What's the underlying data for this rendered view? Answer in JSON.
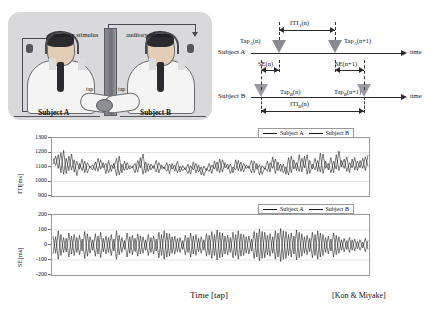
{
  "photo": {
    "stimulus_left_label": "auditory stimulus",
    "stimulus_right_label": "auditory stimulus",
    "tap_left_label": "tap",
    "tap_right_label": "tap",
    "subject_a_label": "Subject A",
    "subject_b_label": "Subject B"
  },
  "timing": {
    "row_a_label": "Subject A",
    "row_b_label": "Subject B",
    "time_axis_a": "time",
    "time_axis_b": "time",
    "iti_a_label": "ITI_A(n)",
    "iti_b_label": "ITI_B(n)",
    "tap_a_n": "Tap_A(n)",
    "tap_a_n1": "Tap_A(n+1)",
    "tap_b_n": "Tap_B(n)",
    "tap_b_n1": "Tap_B(n+1)",
    "se_n": "SE(n)",
    "se_n1": "SE(n+1)"
  },
  "legend": {
    "subject_a": "Subject A",
    "subject_b": "Subject B"
  },
  "captions": {
    "xaxis": "Time [tap]",
    "credit": "[Kon & Miyake]"
  },
  "chart_data": [
    {
      "type": "line",
      "title": "",
      "xlabel": "Time [tap]",
      "ylabel": "ITI [ms]",
      "ylim": [
        900,
        1300
      ],
      "yticks": [
        1300,
        1200,
        1100,
        1000,
        900
      ],
      "grid": true,
      "legend_position": "top-right",
      "x": [
        0,
        1,
        2,
        3,
        4,
        5,
        6,
        7,
        8,
        9,
        10,
        11,
        12,
        13,
        14,
        15,
        16,
        17,
        18,
        19,
        20,
        21,
        22,
        23,
        24,
        25,
        26,
        27,
        28,
        29,
        30,
        31,
        32,
        33,
        34,
        35,
        36,
        37,
        38,
        39,
        40,
        41,
        42,
        43,
        44,
        45,
        46,
        47,
        48,
        49,
        50,
        51,
        52,
        53,
        54,
        55,
        56,
        57,
        58,
        59,
        60,
        61,
        62,
        63,
        64,
        65,
        66,
        67,
        68,
        69,
        70,
        71,
        72,
        73,
        74,
        75,
        76,
        77,
        78,
        79,
        80,
        81,
        82,
        83,
        84,
        85,
        86,
        87,
        88,
        89,
        90,
        91,
        92,
        93,
        94,
        95,
        96,
        97,
        98,
        99,
        100,
        101,
        102,
        103,
        104,
        105,
        106,
        107,
        108,
        109,
        110,
        111,
        112,
        113,
        114,
        115,
        116,
        117,
        118,
        119
      ],
      "series": [
        {
          "name": "Subject A",
          "values": [
            1160,
            1110,
            1185,
            1060,
            1215,
            1055,
            1175,
            1080,
            1150,
            1040,
            1125,
            1075,
            1140,
            1060,
            1105,
            1080,
            1135,
            1070,
            1150,
            1095,
            1125,
            1060,
            1115,
            1090,
            1160,
            1045,
            1120,
            1075,
            1130,
            1085,
            1105,
            1060,
            1145,
            1095,
            1190,
            1060,
            1125,
            1080,
            1110,
            1065,
            1130,
            1090,
            1100,
            1070,
            1120,
            1085,
            1115,
            1060,
            1105,
            1075,
            1095,
            1055,
            1110,
            1080,
            1125,
            1065,
            1100,
            1040,
            1090,
            1070,
            1115,
            1085,
            1135,
            1060,
            1150,
            1095,
            1120,
            1055,
            1100,
            1080,
            1145,
            1070,
            1125,
            1090,
            1105,
            1060,
            1140,
            1085,
            1115,
            1050,
            1095,
            1070,
            1130,
            1090,
            1155,
            1075,
            1120,
            1060,
            1100,
            1045,
            1175,
            1085,
            1130,
            1070,
            1160,
            1095,
            1185,
            1055,
            1120,
            1080,
            1145,
            1065,
            1190,
            1090,
            1125,
            1060,
            1140,
            1085,
            1210,
            1100,
            1155,
            1070,
            1130,
            1095,
            1165,
            1075,
            1145,
            1090,
            1170,
            1105
          ]
        },
        {
          "name": "Subject B",
          "values": [
            1120,
            1175,
            1090,
            1200,
            1050,
            1160,
            1075,
            1190,
            1065,
            1140,
            1085,
            1155,
            1060,
            1130,
            1095,
            1115,
            1075,
            1160,
            1085,
            1130,
            1055,
            1145,
            1070,
            1125,
            1040,
            1175,
            1060,
            1140,
            1080,
            1110,
            1095,
            1125,
            1065,
            1165,
            1050,
            1135,
            1070,
            1120,
            1090,
            1145,
            1060,
            1115,
            1085,
            1130,
            1055,
            1125,
            1070,
            1140,
            1065,
            1110,
            1080,
            1120,
            1050,
            1135,
            1060,
            1115,
            1045,
            1105,
            1075,
            1125,
            1055,
            1140,
            1070,
            1155,
            1065,
            1130,
            1085,
            1120,
            1060,
            1150,
            1075,
            1135,
            1065,
            1115,
            1090,
            1145,
            1060,
            1125,
            1045,
            1110,
            1085,
            1140,
            1065,
            1170,
            1055,
            1135,
            1070,
            1120,
            1050,
            1165,
            1060,
            1150,
            1075,
            1185,
            1065,
            1175,
            1050,
            1145,
            1085,
            1160,
            1070,
            1195,
            1055,
            1140,
            1080,
            1165,
            1060,
            1185,
            1075,
            1145,
            1090,
            1170,
            1060,
            1155,
            1080,
            1140,
            1095,
            1160,
            1075,
            1185
          ]
        }
      ]
    },
    {
      "type": "line",
      "title": "",
      "xlabel": "Time [tap]",
      "ylabel": "SE [ms]",
      "ylim": [
        -200,
        200
      ],
      "yticks": [
        200,
        100,
        0,
        -100,
        -200
      ],
      "grid": true,
      "legend_position": "top-right",
      "x": [
        0,
        1,
        2,
        3,
        4,
        5,
        6,
        7,
        8,
        9,
        10,
        11,
        12,
        13,
        14,
        15,
        16,
        17,
        18,
        19,
        20,
        21,
        22,
        23,
        24,
        25,
        26,
        27,
        28,
        29,
        30,
        31,
        32,
        33,
        34,
        35,
        36,
        37,
        38,
        39,
        40,
        41,
        42,
        43,
        44,
        45,
        46,
        47,
        48,
        49,
        50,
        51,
        52,
        53,
        54,
        55,
        56,
        57,
        58,
        59,
        60,
        61,
        62,
        63,
        64,
        65,
        66,
        67,
        68,
        69,
        70,
        71,
        72,
        73,
        74,
        75,
        76,
        77,
        78,
        79,
        80,
        81,
        82,
        83,
        84,
        85,
        86,
        87,
        88,
        89,
        90,
        91,
        92,
        93,
        94,
        95,
        96,
        97,
        98,
        99,
        100,
        101,
        102,
        103,
        104,
        105,
        106,
        107,
        108,
        109,
        110,
        111,
        112,
        113,
        114,
        115,
        116,
        117,
        118,
        119
      ],
      "series": [
        {
          "name": "Subject A",
          "values": [
            60,
            -55,
            95,
            -70,
            50,
            -45,
            80,
            -60,
            70,
            -50,
            65,
            -40,
            90,
            -75,
            55,
            -35,
            75,
            -60,
            85,
            -45,
            60,
            -50,
            70,
            -40,
            95,
            -65,
            50,
            -30,
            80,
            -55,
            65,
            -45,
            75,
            -60,
            55,
            -35,
            70,
            -50,
            60,
            -40,
            85,
            -70,
            95,
            -80,
            75,
            -55,
            60,
            -45,
            50,
            -30,
            65,
            -50,
            80,
            -60,
            70,
            -45,
            55,
            -35,
            75,
            -65,
            90,
            -70,
            100,
            -85,
            80,
            -60,
            65,
            -50,
            85,
            -70,
            95,
            -75,
            70,
            -55,
            60,
            -40,
            90,
            -80,
            105,
            -90,
            85,
            -65,
            75,
            -55,
            95,
            -80,
            110,
            -95,
            90,
            -70,
            80,
            -60,
            100,
            -85,
            75,
            -55,
            65,
            -45,
            85,
            -70,
            95,
            -80,
            70,
            -50,
            60,
            -40,
            80,
            -65,
            55,
            -35,
            45,
            -30,
            50,
            -35,
            40,
            -25,
            35,
            -20,
            45,
            -30
          ]
        },
        {
          "name": "Subject B",
          "values": [
            -60,
            55,
            -95,
            70,
            -50,
            45,
            -80,
            60,
            -70,
            50,
            -65,
            40,
            -90,
            75,
            -55,
            35,
            -75,
            60,
            -85,
            45,
            -60,
            50,
            -70,
            40,
            -95,
            65,
            -50,
            30,
            -80,
            55,
            -65,
            45,
            -75,
            60,
            -55,
            35,
            -70,
            50,
            -60,
            40,
            -85,
            70,
            -95,
            80,
            -75,
            55,
            -60,
            45,
            -50,
            30,
            -65,
            50,
            -80,
            60,
            -70,
            45,
            -55,
            35,
            -75,
            65,
            -90,
            70,
            -100,
            85,
            -80,
            60,
            -65,
            50,
            -85,
            70,
            -95,
            75,
            -70,
            55,
            -60,
            40,
            -90,
            80,
            -105,
            90,
            -85,
            65,
            -75,
            55,
            -95,
            80,
            -110,
            95,
            -90,
            70,
            -80,
            60,
            -100,
            85,
            -75,
            55,
            -65,
            45,
            -85,
            70,
            -95,
            80,
            -70,
            50,
            -60,
            40,
            -80,
            65,
            -55,
            35,
            -45,
            30,
            -50,
            35,
            -40,
            25,
            -35,
            20,
            -45,
            30
          ]
        }
      ]
    }
  ]
}
